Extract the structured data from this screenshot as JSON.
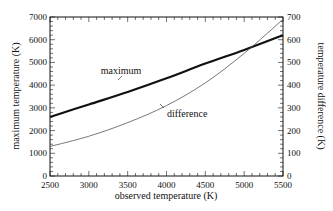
{
  "chart_data": {
    "type": "line",
    "title": "",
    "xlabel": "observed temperature (K)",
    "ylabel": "maximum temperature (K)",
    "y2label": "temperature difference (K)",
    "xlim": [
      2500,
      5500
    ],
    "ylim": [
      0,
      7000
    ],
    "y2lim": [
      0,
      700
    ],
    "x_ticks": [
      2500,
      3000,
      3500,
      4000,
      4500,
      5000,
      5500
    ],
    "y_ticks": [
      0,
      1000,
      2000,
      3000,
      4000,
      5000,
      6000,
      7000
    ],
    "y2_ticks": [
      0,
      100,
      200,
      300,
      400,
      500,
      600,
      700
    ],
    "grid": false,
    "legend": "none (inline annotations)",
    "x": [
      2500,
      3000,
      3500,
      4000,
      4500,
      5000,
      5500
    ],
    "series": [
      {
        "name": "maximum",
        "axis": "left",
        "values": [
          2600,
          3150,
          3700,
          4300,
          4950,
          5550,
          6200
        ],
        "style": "thick black"
      },
      {
        "name": "difference",
        "axis": "right",
        "values": [
          130,
          175,
          235,
          310,
          410,
          540,
          690
        ],
        "style": "thin gray"
      }
    ],
    "annotations": [
      {
        "text": "maximum",
        "x": 3800,
        "y": 4400,
        "points_to": "maximum"
      },
      {
        "text": "difference",
        "x": 4150,
        "y": 2800,
        "points_to": "difference"
      }
    ]
  },
  "labels": {
    "xlabel": "observed temperature (K)",
    "ylabel": "maximum temperature (K)",
    "y2label": "temperature difference (K)",
    "annot_max": "maximum",
    "annot_diff": "difference"
  }
}
